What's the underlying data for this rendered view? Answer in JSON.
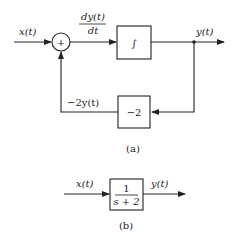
{
  "diagram_a": {
    "input_label": "x(t)",
    "sum_sign": "+",
    "derivative_label_num": "dy(t)",
    "derivative_label_den": "dt",
    "integrator_symbol": "∫",
    "output_label": "y(t)",
    "feedback_label": "−2y(t)",
    "gain_value": "−2",
    "caption": "(a)"
  },
  "diagram_b": {
    "input_label": "x(t)",
    "transfer_num": "1",
    "transfer_den": "s + 2",
    "output_label": "y(t)",
    "caption": "(b)"
  },
  "colors": {
    "stroke": "#222222",
    "background": "#ffffff"
  }
}
